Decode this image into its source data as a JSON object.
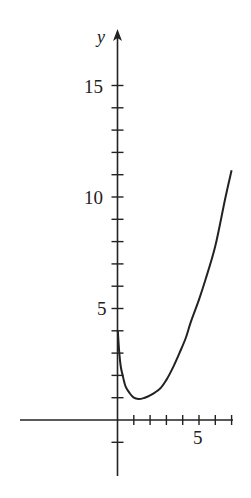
{
  "chart_data": {
    "type": "line",
    "title": "",
    "xlabel": "",
    "ylabel": "y",
    "xlim": [
      -6,
      7.2
    ],
    "ylim": [
      -2.5,
      17.3
    ],
    "grid": false,
    "legend": null,
    "x_ticks": [
      1,
      2,
      3,
      4,
      5,
      6,
      7
    ],
    "x_tick_labels": [
      {
        "value": 5,
        "label": "5"
      }
    ],
    "y_ticks": [
      -1,
      1,
      2,
      3,
      4,
      5,
      6,
      7,
      8,
      9,
      10,
      11,
      12,
      13,
      14,
      15
    ],
    "y_tick_labels": [
      {
        "value": 5,
        "label": "5"
      },
      {
        "value": 10,
        "label": "10"
      },
      {
        "value": 15,
        "label": "15"
      }
    ],
    "series": [
      {
        "name": "curve",
        "color": "#222222",
        "x": [
          0.02,
          0.1,
          0.2,
          0.35,
          0.5,
          0.75,
          1.0,
          1.3,
          1.6,
          2.0,
          2.6,
          3.0,
          3.4,
          3.8,
          4.2,
          4.5,
          5.0,
          5.4,
          6.0,
          6.6,
          7.0
        ],
        "y": [
          4.0,
          3.1,
          2.4,
          1.9,
          1.5,
          1.2,
          1.0,
          0.94,
          0.98,
          1.1,
          1.4,
          1.8,
          2.35,
          3.0,
          3.7,
          4.4,
          5.4,
          6.3,
          7.8,
          9.9,
          11.2
        ]
      }
    ]
  },
  "labels": {
    "y_axis_name": "y",
    "y15": "15",
    "y10": "10",
    "y5": "5",
    "x5": "5"
  }
}
